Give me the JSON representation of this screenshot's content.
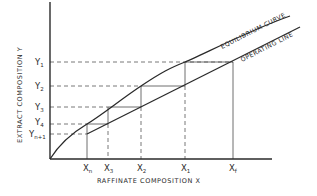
{
  "diagram": {
    "type": "liquid-liquid extraction McCabe-Thiele style stage construction",
    "axes": {
      "x_title": "RAFFINATE COMPOSITION  X",
      "y_title": "EXTRACT COMPOSITION  Y"
    },
    "curves": {
      "equilibrium": "EQUILIBRIUM CURVE",
      "operating": "OPERATING LINE"
    },
    "x_ticks": [
      {
        "main": "X",
        "sub": "n"
      },
      {
        "main": "X",
        "sub": "3"
      },
      {
        "main": "X",
        "sub": "2"
      },
      {
        "main": "X",
        "sub": "1"
      },
      {
        "main": "X",
        "sub": "f"
      }
    ],
    "y_ticks": [
      {
        "main": "Y",
        "sub": "1"
      },
      {
        "main": "Y",
        "sub": "2"
      },
      {
        "main": "Y",
        "sub": "3"
      },
      {
        "main": "Y",
        "sub": "4"
      },
      {
        "main": "Y",
        "sub": "n+1"
      }
    ]
  }
}
